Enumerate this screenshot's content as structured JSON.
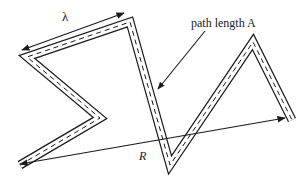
{
  "diagram": {
    "labels": {
      "wavelength": "λ",
      "path_length": "path length A",
      "distance": "R"
    },
    "colors": {
      "stroke": "#1a1a1a",
      "background": "#ffffff"
    },
    "path_vertices": [
      [
        20,
        165
      ],
      [
        100,
        118
      ],
      [
        27,
        57
      ],
      [
        130,
        22
      ],
      [
        170,
        165
      ],
      [
        253,
        42
      ],
      [
        292,
        120
      ]
    ]
  }
}
